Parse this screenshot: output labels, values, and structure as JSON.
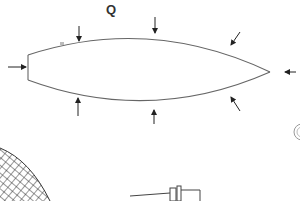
{
  "diagram": {
    "label": "Q",
    "stroke_color": "#555555",
    "arrow_color": "#222222",
    "body_shape": "lens-shaped body with blunt left edge and pointed right tip",
    "arrows": [
      {
        "position": "left",
        "direction": "right"
      },
      {
        "position": "top-left",
        "direction": "down"
      },
      {
        "position": "top-center",
        "direction": "down"
      },
      {
        "position": "top-right",
        "direction": "down-left"
      },
      {
        "position": "right-tip",
        "direction": "left"
      },
      {
        "position": "bottom-left",
        "direction": "up"
      },
      {
        "position": "bottom-center",
        "direction": "up"
      },
      {
        "position": "bottom-right",
        "direction": "up-left"
      }
    ],
    "partial_elements": [
      "mesh-net",
      "mechanical-part",
      "circle-fragment"
    ]
  }
}
